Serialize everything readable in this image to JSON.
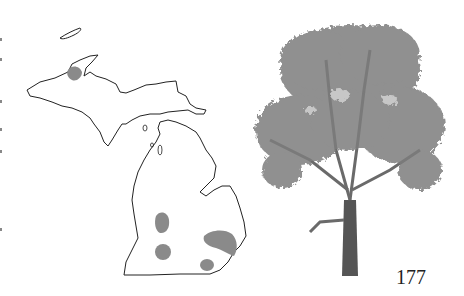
{
  "page": {
    "page_number": "177"
  },
  "range_map": {
    "region": "Michigan",
    "outline_color": "#222222",
    "range_fill_color": "#8a8a8a",
    "range_areas": [
      {
        "name": "upper-peninsula-keweenaw-area"
      },
      {
        "name": "southwest-lower-north"
      },
      {
        "name": "southwest-lower-south"
      },
      {
        "name": "southeast-lower-large"
      },
      {
        "name": "southeast-lower-small"
      }
    ]
  },
  "illustration": {
    "subject": "tree",
    "foliage_color": "#7d7d7d",
    "trunk_color": "#555555"
  }
}
